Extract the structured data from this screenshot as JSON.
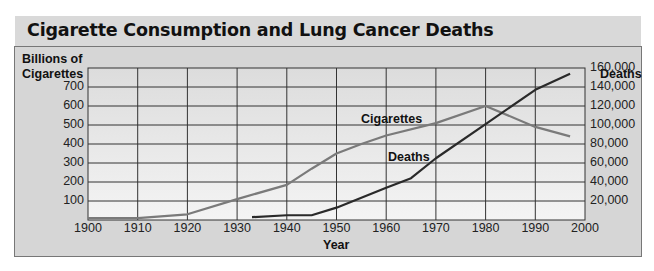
{
  "title": "Cigarette Consumption and Lung Cancer Deaths",
  "chart_data": {
    "type": "line",
    "title": "Cigarette Consumption and Lung Cancer Deaths",
    "xlabel": "Year",
    "ylabel_left": "Billions of Cigarettes",
    "ylabel_right": "Deaths",
    "xlim": [
      1900,
      2000
    ],
    "ylim_left": [
      0,
      800
    ],
    "ylim_right": [
      0,
      160000
    ],
    "x_ticks": [
      "1900",
      "1910",
      "1920",
      "1930",
      "1940",
      "1950",
      "1960",
      "1970",
      "1980",
      "1990",
      "2000"
    ],
    "y_left_ticks": [
      "100",
      "200",
      "300",
      "400",
      "500",
      "600",
      "700"
    ],
    "y_right_ticks": [
      "20,000",
      "40,000",
      "60,000",
      "80,000",
      "100,000",
      "120,000",
      "140,000",
      "160,000"
    ],
    "grid": true,
    "series": [
      {
        "name": "Cigarettes",
        "axis": "left",
        "color": "#7a7a7a",
        "x": [
          1900,
          1910,
          1920,
          1930,
          1940,
          1945,
          1950,
          1955,
          1960,
          1970,
          1980,
          1990,
          1997
        ],
        "values": [
          10,
          10,
          30,
          110,
          185,
          270,
          350,
          400,
          445,
          510,
          600,
          490,
          440
        ]
      },
      {
        "name": "Deaths",
        "axis": "right",
        "color": "#2a2a2a",
        "x": [
          1933,
          1940,
          1945,
          1950,
          1960,
          1965,
          1970,
          1980,
          1990,
          1997
        ],
        "values": [
          3000,
          5000,
          5000,
          13000,
          34000,
          44000,
          65000,
          101000,
          137000,
          154000
        ]
      }
    ],
    "annotations": [
      {
        "text": "Cigarettes",
        "x": 1974,
        "y_left": 520
      },
      {
        "text": "Deaths",
        "x": 1960,
        "y_left": 340
      }
    ]
  },
  "labels": {
    "left_axis_line1": "Billions of",
    "left_axis_line2": "Cigarettes",
    "right_axis": "Deaths",
    "x_axis": "Year",
    "cig_annotation": "Cigarettes",
    "deaths_annotation": "Deaths"
  }
}
